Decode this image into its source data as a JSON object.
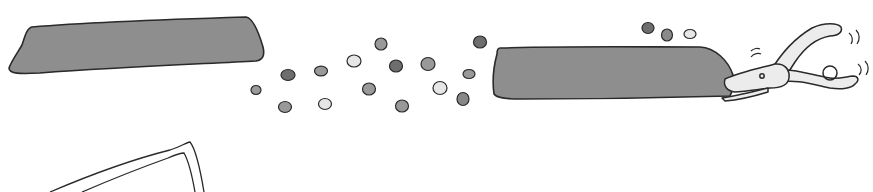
{
  "instruction": {
    "step_number": "4",
    "text": "Use the dots to cover and color the picture you drew"
  },
  "illustration": {
    "strip_color": "#8c8c8c",
    "outline_color": "#2a2a2a",
    "dot_shades": {
      "dark": "#6e6e6e",
      "mid": "#999999",
      "light": "#e6e6e6"
    },
    "tool_color": "#ececec",
    "items": [
      "paper-strip-left",
      "paper-strip-right",
      "loose-dots",
      "hole-punch",
      "drawing-frame"
    ]
  }
}
